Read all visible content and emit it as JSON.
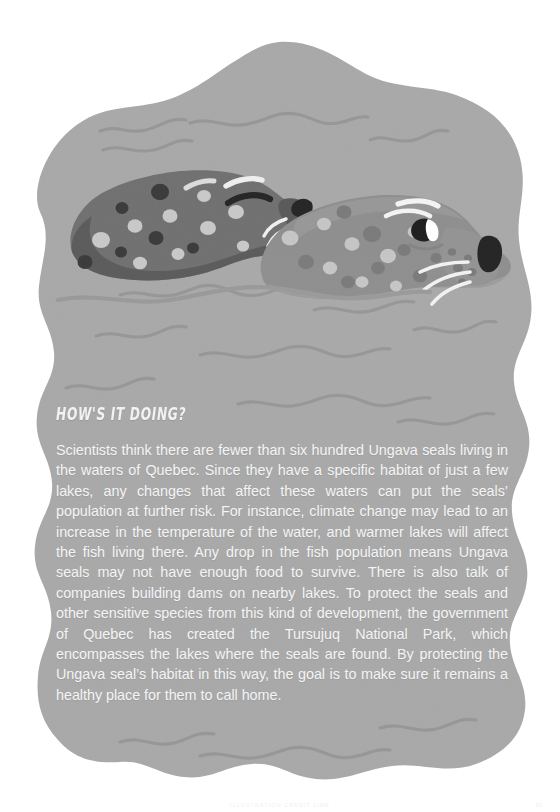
{
  "page": {
    "width": 560,
    "height": 812,
    "background_color": "#ffffff"
  },
  "illustration": {
    "name": "ungava-seals-illustration",
    "description": "Two spotted seals resting on wavy water, drawn on a grey organic blob background",
    "blob": {
      "fill_color": "#a9a9a9",
      "wave_line_color": "#939393"
    },
    "seal_back": {
      "name": "back-seal",
      "body_color": "#6e6e6e",
      "shadow_color": "#5a5a5a",
      "spot_light_color": "#c8c8c8",
      "spot_dark_color": "#3a3a3a",
      "nose_color": "#2b2b2b",
      "eye_color": "#2b2b2b",
      "whisker_color": "#f0f0f0"
    },
    "seal_front": {
      "name": "front-seal",
      "body_color": "#8d8d8d",
      "belly_color": "#9b9b9b",
      "spot_light_color": "#c6c6c6",
      "spot_dark_color": "#7a7a7a",
      "nose_color": "#2b2b2b",
      "eye_color": "#1f1f1f",
      "eye_highlight_color": "#ffffff",
      "whisker_color": "#f2f2f2"
    }
  },
  "article": {
    "heading": "HOW'S IT DOING?",
    "heading_color": "#f2f2f2",
    "body_color": "#f4f4f4",
    "body_paragraphs": [
      "Scientists think there are fewer than six hundred Ungava seals living in the waters of Quebec. Since they have a specific habitat of just a few lakes, any changes that affect these waters can put the seals’ population at further risk. For instance, climate change may lead to an increase in the temperature of the water, and warmer lakes will affect the fish living there. Any drop in the fish population means Ungava seals may not have enough food to survive. There is also talk of companies building dams on nearby lakes. To protect the seals and other sensitive species from this kind of development, the government of Quebec has created the Tursujuq National Park, which encompasses the lakes where the seals are found. By protecting the Ungava seal’s habitat in this way, the goal is to make sure it remains a healthy place for them to call home."
    ]
  },
  "footer": {
    "credit": "ILLUSTRATION CREDIT LINE",
    "page_number": "31"
  }
}
